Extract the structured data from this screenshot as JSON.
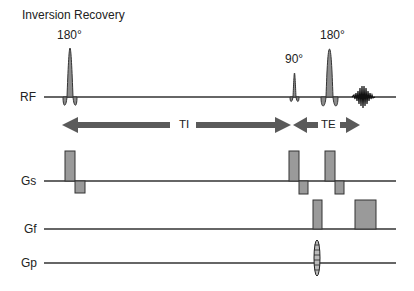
{
  "title": "Inversion Recovery",
  "rows": {
    "rf": {
      "label": "RF"
    },
    "gs": {
      "label": "Gs"
    },
    "gf": {
      "label": "Gf"
    },
    "gp": {
      "label": "Gp"
    }
  },
  "pulses": {
    "inversion": {
      "flip_angle": "180°"
    },
    "excitation": {
      "flip_angle": "90°"
    },
    "refocusing": {
      "flip_angle": "180°"
    }
  },
  "intervals": {
    "ti": {
      "label": "TI"
    },
    "te": {
      "label": "TE"
    }
  },
  "colors": {
    "fill": "#8c8c8c",
    "line": "#333333",
    "arrow": "#5a5a5a"
  }
}
